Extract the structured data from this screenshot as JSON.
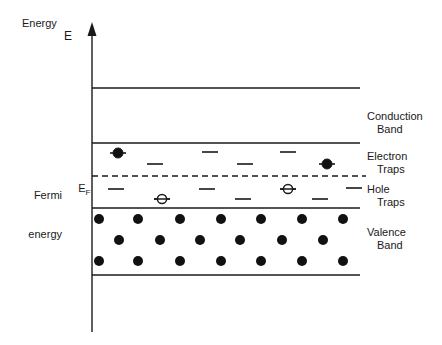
{
  "figure": {
    "background_color": "#ffffff",
    "line_color": "#1a1a1a",
    "carrier_fill_color": "#111111"
  },
  "axis": {
    "name": "energy-axis",
    "title": "Energy",
    "symbol": "E",
    "orientation": "vertical",
    "arrow": "up",
    "x": 92,
    "y_top": 22,
    "y_bottom": 332
  },
  "left_labels": {
    "fermi_line1": "Fermi",
    "fermi_line2": "energy",
    "fermi_symbol_base": "E",
    "fermi_symbol_sub": "F"
  },
  "right_labels": [
    {
      "name": "conduction-band-label",
      "line1": "Conduction",
      "line2": "Band",
      "x": 367,
      "y": 110
    },
    {
      "name": "electron-traps-label",
      "line1": "Electron",
      "line2": "Traps",
      "x": 367,
      "y": 150
    },
    {
      "name": "hole-traps-label",
      "line1": "Hole",
      "line2": "Traps",
      "x": 367,
      "y": 183
    },
    {
      "name": "valence-band-label",
      "line1": "Valence",
      "line2": "Band",
      "x": 367,
      "y": 226
    }
  ],
  "band_edges": {
    "x_left": 92,
    "x_right": 360,
    "conduction_band_top": 88,
    "conduction_band_bottom": 143,
    "valence_band_top": 208,
    "valence_band_bottom": 275
  },
  "fermi_level": {
    "name": "fermi-level-line",
    "y": 176,
    "x_left": 92,
    "x_right": 366,
    "style": "dashed",
    "dash_pattern": "6,4"
  },
  "electron_traps": {
    "region_top": 143,
    "region_bottom": 176,
    "dash_width": 16,
    "levels": [
      {
        "x": 118,
        "y": 153,
        "occupied": true,
        "carrier": "electron"
      },
      {
        "x": 155,
        "y": 164,
        "occupied": false,
        "carrier": "electron"
      },
      {
        "x": 210,
        "y": 152,
        "occupied": false,
        "carrier": "electron"
      },
      {
        "x": 245,
        "y": 164,
        "occupied": false,
        "carrier": "electron"
      },
      {
        "x": 288,
        "y": 152,
        "occupied": false,
        "carrier": "electron"
      },
      {
        "x": 327,
        "y": 164,
        "occupied": true,
        "carrier": "electron"
      }
    ]
  },
  "hole_traps": {
    "region_top": 176,
    "region_bottom": 208,
    "dash_width": 16,
    "levels": [
      {
        "x": 116,
        "y": 189,
        "occupied": false,
        "carrier": "hole"
      },
      {
        "x": 162,
        "y": 199,
        "occupied": true,
        "carrier": "hole"
      },
      {
        "x": 207,
        "y": 189,
        "occupied": false,
        "carrier": "hole"
      },
      {
        "x": 243,
        "y": 199,
        "occupied": false,
        "carrier": "hole"
      },
      {
        "x": 288,
        "y": 189,
        "occupied": true,
        "carrier": "hole"
      },
      {
        "x": 320,
        "y": 199,
        "occupied": false,
        "carrier": "hole"
      },
      {
        "x": 354,
        "y": 188,
        "occupied": false,
        "carrier": "hole"
      }
    ]
  },
  "valence_band_carriers": {
    "symbol": "filled-circle",
    "radius": 5,
    "rows": [
      {
        "y": 219,
        "x": [
          99,
          138,
          180,
          221,
          261,
          302,
          343
        ]
      },
      {
        "y": 240,
        "x": [
          119,
          160,
          200,
          240,
          282,
          323
        ]
      },
      {
        "y": 261,
        "x": [
          99,
          138,
          180,
          221,
          261,
          302,
          343
        ]
      }
    ]
  },
  "legend": {
    "filled_circle_meaning": "electron",
    "open_circle_meaning": "hole",
    "dash_meaning": "empty trap level"
  }
}
